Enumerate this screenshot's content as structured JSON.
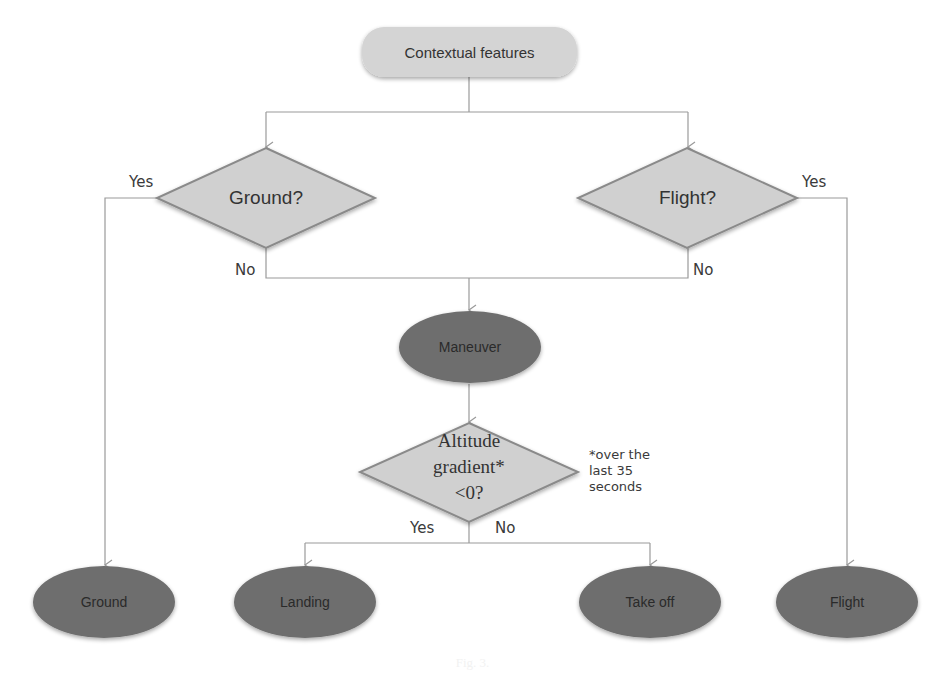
{
  "diagram": {
    "type": "flowchart",
    "start": {
      "label": "Contextual features"
    },
    "decisions": {
      "ground": {
        "label": "Ground?",
        "yes": "Yes",
        "no": "No"
      },
      "flight": {
        "label": "Flight?",
        "yes": "Yes",
        "no": "No"
      },
      "altitude": {
        "lines": [
          "Altitude",
          "gradient*",
          "<0?"
        ],
        "yes": "Yes",
        "no": "No",
        "note_lines": [
          "*over the",
          "last 35",
          "seconds"
        ]
      }
    },
    "states": {
      "maneuver": {
        "label": "Maneuver"
      },
      "ground": {
        "label": "Ground"
      },
      "landing": {
        "label": "Landing"
      },
      "takeoff": {
        "label": "Take off"
      },
      "flight": {
        "label": "Flight"
      }
    },
    "colors": {
      "start_fill": "#d4d4d4",
      "decision_fill": "#d0d0d0",
      "decision_stroke": "#8a8a8a",
      "state_fill": "#6e6e6e",
      "connector": "#9a9a9a",
      "text": "#2a2a2a"
    },
    "edges": [
      {
        "from": "Contextual features",
        "to": "Ground?"
      },
      {
        "from": "Contextual features",
        "to": "Flight?"
      },
      {
        "from": "Ground?",
        "to": "Ground",
        "label": "Yes"
      },
      {
        "from": "Ground?",
        "to": "Maneuver",
        "label": "No"
      },
      {
        "from": "Flight?",
        "to": "Flight",
        "label": "Yes"
      },
      {
        "from": "Flight?",
        "to": "Maneuver",
        "label": "No"
      },
      {
        "from": "Maneuver",
        "to": "Altitude gradient* <0?"
      },
      {
        "from": "Altitude gradient* <0?",
        "to": "Landing",
        "label": "Yes"
      },
      {
        "from": "Altitude gradient* <0?",
        "to": "Take off",
        "label": "No"
      }
    ]
  },
  "caption": "Fig. 3."
}
